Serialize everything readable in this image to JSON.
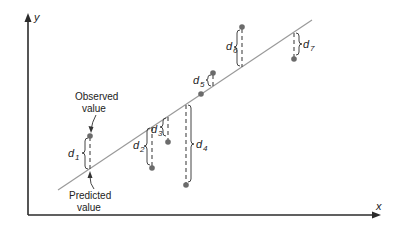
{
  "diagram": {
    "axes": {
      "x_label": "x",
      "y_label": "y"
    },
    "annotations": {
      "observed_line1": "Observed",
      "observed_line2": "value",
      "predicted_line1": "Predicted",
      "predicted_line2": "value"
    },
    "residuals": [
      {
        "label": "d",
        "sub": "1",
        "x": 90,
        "observed_y": 136,
        "predicted_y": 169
      },
      {
        "label": "d",
        "sub": "2",
        "x": 152,
        "observed_y": 168,
        "predicted_y": 127
      },
      {
        "label": "d",
        "sub": "3",
        "x": 168,
        "observed_y": 142,
        "predicted_y": 116
      },
      {
        "label": "d",
        "sub": "4",
        "x": 186,
        "observed_y": 185,
        "predicted_y": 104
      },
      {
        "label": "d",
        "sub": "5",
        "x": 213,
        "observed_y": 73,
        "predicted_y": 86
      },
      {
        "label": "d",
        "sub": "6",
        "x": 242,
        "observed_y": 27,
        "predicted_y": 67
      },
      {
        "label": "d",
        "sub": "7",
        "x": 294,
        "observed_y": 59,
        "predicted_y": 32
      }
    ],
    "colors": {
      "axis": "#2b2b2b",
      "regression_line": "#9a9a9a",
      "point": "#6b6b6b"
    }
  }
}
